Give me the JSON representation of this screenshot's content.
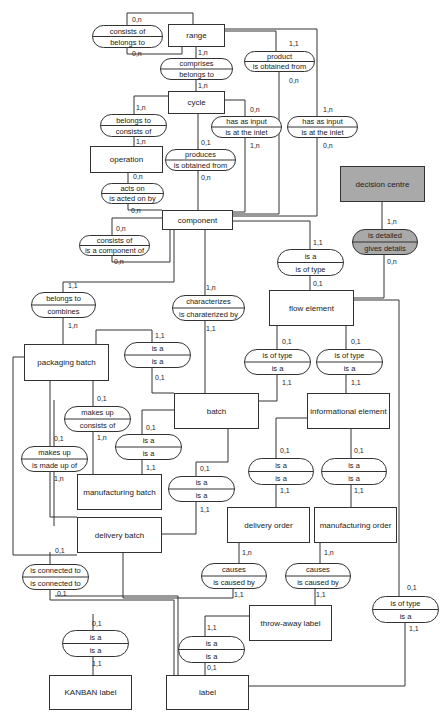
{
  "entities": [
    {
      "id": "range",
      "label": "range",
      "x": 168,
      "y": 24,
      "w": 56,
      "h": 22
    },
    {
      "id": "cycle",
      "label": "cycle",
      "x": 168,
      "y": 91,
      "w": 56,
      "h": 22
    },
    {
      "id": "operation",
      "label": "operation",
      "x": 90,
      "y": 146,
      "w": 72,
      "h": 26
    },
    {
      "id": "component",
      "label": "component",
      "x": 162,
      "y": 210,
      "w": 70,
      "h": 19
    },
    {
      "id": "decision_centre",
      "label": "decision centre",
      "x": 340,
      "y": 166,
      "w": 84,
      "h": 35,
      "shaded": true
    },
    {
      "id": "flow_element",
      "label": "flow element",
      "x": 269,
      "y": 290,
      "w": 84,
      "h": 35
    },
    {
      "id": "packaging_batch",
      "label": "packaging batch",
      "x": 24,
      "y": 344,
      "w": 84,
      "h": 36
    },
    {
      "id": "batch",
      "label": "batch",
      "x": 174,
      "y": 393,
      "w": 84,
      "h": 35
    },
    {
      "id": "informational_element",
      "label": "informational element",
      "x": 307,
      "y": 393,
      "w": 82,
      "h": 35
    },
    {
      "id": "manufacturing_batch",
      "label": "manufacturing batch",
      "x": 77,
      "y": 474,
      "w": 84,
      "h": 35
    },
    {
      "id": "delivery_batch",
      "label": "delivery batch",
      "x": 77,
      "y": 517,
      "w": 84,
      "h": 35
    },
    {
      "id": "delivery_order",
      "label": "delivery order",
      "x": 227,
      "y": 507,
      "w": 82,
      "h": 35
    },
    {
      "id": "manufacturing_order",
      "label": "manufacturing order",
      "x": 314,
      "y": 507,
      "w": 82,
      "h": 35
    },
    {
      "id": "throw_away_label",
      "label": "throw-away label",
      "x": 249,
      "y": 605,
      "w": 82,
      "h": 35
    },
    {
      "id": "kanban_label",
      "label": "KANBAN label",
      "x": 49,
      "y": 675,
      "w": 82,
      "h": 34
    },
    {
      "id": "label",
      "label": "label",
      "x": 166,
      "y": 675,
      "w": 82,
      "h": 34
    }
  ],
  "relationships": [
    {
      "id": "consists_of_range",
      "top": "consists of",
      "bottom": "belongs to",
      "x": 92,
      "y": 25,
      "w": 70,
      "h": 22,
      "cards": [
        {
          "t": "0,n",
          "x": 132,
          "y": 22
        },
        {
          "t": "0,n",
          "x": 132,
          "y": 56
        }
      ]
    },
    {
      "id": "comprises",
      "top": "comprises",
      "bottom": "belongs to",
      "x": 160,
      "y": 58,
      "w": 72,
      "h": 21,
      "cards": [
        {
          "t": "1,n",
          "x": 198,
          "y": 55
        },
        {
          "t": "1,n",
          "x": 198,
          "y": 88
        }
      ]
    },
    {
      "id": "product",
      "top": "product",
      "bottom": "is obtained from",
      "x": 244,
      "y": 51,
      "w": 70,
      "h": 20,
      "cards": [
        {
          "t": "1,1",
          "x": 289,
          "y": 46
        },
        {
          "t": "0,n",
          "x": 289,
          "y": 83
        }
      ]
    },
    {
      "id": "belongs_to_cycle",
      "top": "belongs to",
      "bottom": "consists of",
      "x": 100,
      "y": 114,
      "w": 66,
      "h": 22,
      "cards": [
        {
          "t": "1,n",
          "x": 136,
          "y": 110
        },
        {
          "t": "1,n",
          "x": 136,
          "y": 144
        }
      ]
    },
    {
      "id": "has_input_1",
      "top": "has as input",
      "bottom": "is at the inlet",
      "x": 211,
      "y": 116,
      "w": 70,
      "h": 21,
      "cards": [
        {
          "t": "0,n",
          "x": 250,
          "y": 112
        },
        {
          "t": "1,n",
          "x": 250,
          "y": 148
        }
      ]
    },
    {
      "id": "has_input_2",
      "top": "has as input",
      "bottom": "is at the inlet",
      "x": 287,
      "y": 116,
      "w": 70,
      "h": 21,
      "cards": [
        {
          "t": "1,n",
          "x": 323,
          "y": 112
        },
        {
          "t": "0,n",
          "x": 323,
          "y": 148
        }
      ]
    },
    {
      "id": "produces",
      "top": "produces",
      "bottom": "is obtained from",
      "x": 165,
      "y": 149,
      "w": 70,
      "h": 21,
      "cards": [
        {
          "t": "0,1",
          "x": 201,
          "y": 145
        },
        {
          "t": "0,n",
          "x": 201,
          "y": 180
        }
      ]
    },
    {
      "id": "acts_on",
      "top": "acts on",
      "bottom": "is acted on by",
      "x": 101,
      "y": 183,
      "w": 62,
      "h": 20,
      "cards": [
        {
          "t": "0,n",
          "x": 133,
          "y": 179
        },
        {
          "t": "0,n",
          "x": 131,
          "y": 213
        }
      ]
    },
    {
      "id": "consists_of_component",
      "top": "consists of",
      "bottom": "is a component of",
      "x": 79,
      "y": 235,
      "w": 70,
      "h": 20,
      "cards": [
        {
          "t": "0,n",
          "x": 116,
          "y": 231
        },
        {
          "t": "0,n",
          "x": 114,
          "y": 264
        }
      ]
    },
    {
      "id": "is_detailed",
      "top": "is detailed",
      "bottom": "gives details",
      "x": 352,
      "y": 229,
      "w": 65,
      "h": 25,
      "shaded": true,
      "cards": [
        {
          "t": "1,n",
          "x": 387,
          "y": 224
        },
        {
          "t": "0,n",
          "x": 387,
          "y": 264
        }
      ]
    },
    {
      "id": "is_a_flow",
      "top": "is a",
      "bottom": "is of type",
      "x": 277,
      "y": 249,
      "w": 66,
      "h": 26,
      "cards": [
        {
          "t": "1,1",
          "x": 313,
          "y": 245
        },
        {
          "t": "0,1",
          "x": 313,
          "y": 286
        }
      ]
    },
    {
      "id": "belongs_to_combines",
      "top": "belongs to",
      "bottom": "combines",
      "x": 31,
      "y": 292,
      "w": 64,
      "h": 25,
      "cards": [
        {
          "t": "1,1",
          "x": 68,
          "y": 288
        },
        {
          "t": "1,n",
          "x": 68,
          "y": 328
        }
      ]
    },
    {
      "id": "characterizes",
      "top": "characterizes",
      "bottom": "is charaterized by",
      "x": 172,
      "y": 295,
      "w": 72,
      "h": 25,
      "cards": [
        {
          "t": "1,n",
          "x": 206,
          "y": 290
        },
        {
          "t": "1,1",
          "x": 206,
          "y": 331
        }
      ]
    },
    {
      "id": "is_a_packaging",
      "top": "is a",
      "bottom": "is a",
      "x": 124,
      "y": 342,
      "w": 66,
      "h": 25,
      "cards": [
        {
          "t": "1,1",
          "x": 155,
          "y": 338
        },
        {
          "t": "0,1",
          "x": 155,
          "y": 380
        }
      ]
    },
    {
      "id": "is_of_type_batch",
      "top": "is of type",
      "bottom": "is a",
      "x": 244,
      "y": 349,
      "w": 66,
      "h": 25,
      "cards": [
        {
          "t": "0,1",
          "x": 282,
          "y": 344
        },
        {
          "t": "1,1",
          "x": 282,
          "y": 385
        }
      ]
    },
    {
      "id": "is_of_type_info",
      "top": "is of type",
      "bottom": "is a",
      "x": 316,
      "y": 349,
      "w": 66,
      "h": 25,
      "cards": [
        {
          "t": "0,1",
          "x": 351,
          "y": 344
        },
        {
          "t": "1,1",
          "x": 351,
          "y": 385
        }
      ]
    },
    {
      "id": "makes_up_consists",
      "top": "makes up",
      "bottom": "consists of",
      "x": 64,
      "y": 406,
      "w": 66,
      "h": 25,
      "cards": [
        {
          "t": "0,1",
          "x": 97,
          "y": 401
        },
        {
          "t": "1,n",
          "x": 97,
          "y": 440
        }
      ]
    },
    {
      "id": "is_a_manufacturing",
      "top": "is a",
      "bottom": "is a",
      "x": 115,
      "y": 434,
      "w": 66,
      "h": 25,
      "cards": [
        {
          "t": "0,1",
          "x": 146,
          "y": 430
        },
        {
          "t": "1,1",
          "x": 146,
          "y": 470
        }
      ]
    },
    {
      "id": "makes_up_made_of",
      "top": "makes up",
      "bottom": "is made up of",
      "x": 21,
      "y": 446,
      "w": 66,
      "h": 25,
      "cards": [
        {
          "t": "0,1",
          "x": 54,
          "y": 441
        },
        {
          "t": "1,n",
          "x": 54,
          "y": 481
        }
      ]
    },
    {
      "id": "is_a_delivery_batch",
      "top": "is a",
      "bottom": "is a",
      "x": 168,
      "y": 476,
      "w": 66,
      "h": 25,
      "cards": [
        {
          "t": "0,1",
          "x": 200,
          "y": 471
        },
        {
          "t": "1,1",
          "x": 200,
          "y": 512
        }
      ]
    },
    {
      "id": "is_a_delivery_order",
      "top": "is a",
      "bottom": "is a",
      "x": 248,
      "y": 458,
      "w": 65,
      "h": 26,
      "cards": [
        {
          "t": "0,1",
          "x": 280,
          "y": 453
        },
        {
          "t": "1,1",
          "x": 280,
          "y": 493
        }
      ]
    },
    {
      "id": "is_a_manufacturing_order",
      "top": "is a",
      "bottom": "is a",
      "x": 321,
      "y": 458,
      "w": 65,
      "h": 26,
      "cards": [
        {
          "t": "0,1",
          "x": 354,
          "y": 453
        },
        {
          "t": "1,1",
          "x": 354,
          "y": 493
        }
      ]
    },
    {
      "id": "causes_1",
      "top": "causes",
      "bottom": "is caused by",
      "x": 201,
      "y": 563,
      "w": 65,
      "h": 25,
      "cards": [
        {
          "t": "1,n",
          "x": 242,
          "y": 555
        },
        {
          "t": "1,1",
          "x": 234,
          "y": 597
        }
      ]
    },
    {
      "id": "causes_2",
      "top": "causes",
      "bottom": "is caused by",
      "x": 285,
      "y": 563,
      "w": 65,
      "h": 25,
      "cards": [
        {
          "t": "1,n",
          "x": 324,
          "y": 555
        },
        {
          "t": "1,1",
          "x": 316,
          "y": 597
        }
      ]
    },
    {
      "id": "is_connected_to",
      "top": "is connected to",
      "bottom": "is connected to",
      "x": 22,
      "y": 564,
      "w": 66,
      "h": 25,
      "cards": [
        {
          "t": "0,1",
          "x": 55,
          "y": 553
        },
        {
          "t": "0,1",
          "x": 57,
          "y": 596
        }
      ]
    },
    {
      "id": "is_of_type_label",
      "top": "is of type",
      "bottom": "is a",
      "x": 372,
      "y": 596,
      "w": 66,
      "h": 26,
      "cards": [
        {
          "t": "0,1",
          "x": 407,
          "y": 590
        },
        {
          "t": "1,1",
          "x": 409,
          "y": 631
        }
      ]
    },
    {
      "id": "is_a_kanban",
      "top": "is a",
      "bottom": "is a",
      "x": 62,
      "y": 630,
      "w": 66,
      "h": 26,
      "cards": [
        {
          "t": "0,1",
          "x": 92,
          "y": 626
        },
        {
          "t": "1,1",
          "x": 92,
          "y": 666
        }
      ]
    },
    {
      "id": "is_a_throwaway",
      "top": "is a",
      "bottom": "is a",
      "x": 178,
      "y": 636,
      "w": 66,
      "h": 26,
      "cards": [
        {
          "t": "1,1",
          "x": 207,
          "y": 630
        },
        {
          "t": "0,1",
          "x": 207,
          "y": 670
        }
      ]
    }
  ],
  "connectors": [
    "M193,24 V13 H127 V25",
    "M127,47 V54 H182 V46",
    "M196,46 V58",
    "M196,79 V91",
    "M224,31 H276 V51",
    "M224,29 H317 V216 H232",
    "M168,96 H134 V114",
    "M134,136 V146",
    "M224,100 H245 V116",
    "M245,137 V212 H232",
    "M317,116 V137",
    "M279,71 V214 H232",
    "M198,113 V149",
    "M198,170 V210",
    "M128,172 V183",
    "M128,203 V210 H162",
    "M162,218 H112 V235",
    "M112,255 V262 H170 V229",
    "M232,221 H310 V249",
    "M310,275 V290",
    "M382,201 V229",
    "M384,254 V298 H353",
    "M174,229 V282 H63 V292",
    "M63,317 V344",
    "M205,229 V295",
    "M205,320 V393",
    "M96,344 V330 H152 V342",
    "M152,367 V393 H174",
    "M277,325 V349",
    "M277,374 V401 H258",
    "M346,325 V349",
    "M346,374 V393",
    "M353,300 H399 V596",
    "M24,357 H13 V555 H77",
    "M50,380 V517 H77",
    "M93,380 V406",
    "M93,431 V474",
    "M174,410 H142 V434",
    "M142,459 V474",
    "M54,400 V446",
    "M54,471 V526",
    "M228,428 V462 H196 V476",
    "M196,501 V534 H161",
    "M307,418 H276 V458",
    "M276,484 V507",
    "M351,428 V458",
    "M351,484 V507",
    "M239,542 V563",
    "M233,588 V598 H123 V552",
    "M320,542 V563",
    "M315,588 V605",
    "M50,552 V564",
    "M50,589 V600 H174 V675",
    "M55,596 H178 V675",
    "M93,614 V630",
    "M93,656 V675",
    "M249,616 H205 V636",
    "M205,662 V675",
    "M405,622 V686 H248"
  ]
}
